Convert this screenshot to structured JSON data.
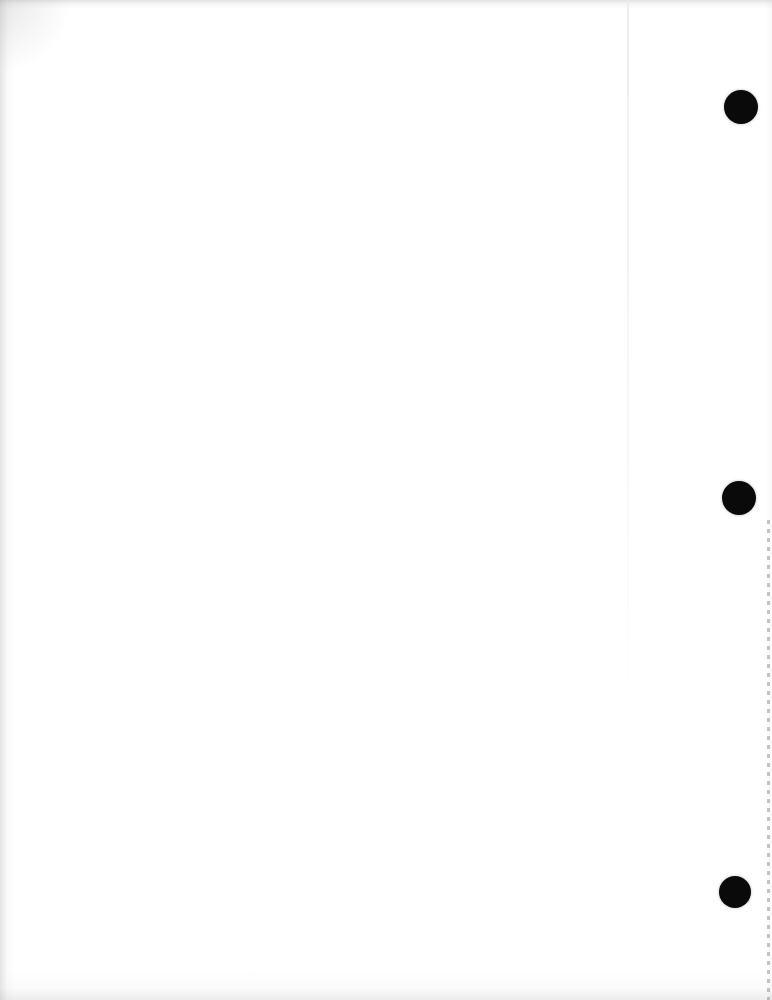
{
  "page": {
    "kind": "scanned-document-page",
    "content_text": "",
    "background_color": "#ffffff",
    "width": 772,
    "height": 1000
  },
  "marks": {
    "punch_holes": [
      {
        "name": "punch-hole-top",
        "cx": 741,
        "cy": 107,
        "diameter": 34,
        "color": "#0a0a0a"
      },
      {
        "name": "punch-hole-middle",
        "cx": 739,
        "cy": 498,
        "diameter": 34,
        "color": "#0a0a0a"
      },
      {
        "name": "punch-hole-bottom",
        "cx": 735,
        "cy": 892,
        "diameter": 32,
        "color": "#0a0a0a"
      }
    ],
    "perforation_line": {
      "name": "perforation-line",
      "x": 767,
      "y_start": 520,
      "y_end": 1000,
      "color": "#969696"
    },
    "seam_line": {
      "name": "fold-seam-line",
      "x": 627,
      "y_start": 0,
      "y_end": 720,
      "color": "#ebebeb"
    }
  },
  "edges": {
    "top_shadow_color": "#a0a0a0",
    "left_shadow_color": "#a8a8a8",
    "bottom_shadow_color": "#aaaaaa",
    "right_shadow_color": "#cdcdcd"
  }
}
